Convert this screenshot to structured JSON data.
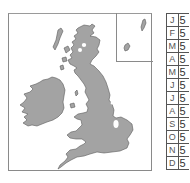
{
  "map": {
    "region": "British Isles",
    "land_color": "#a3a3a3",
    "outline_color": "#5a5a5a",
    "frame_color": "#8a8a8a",
    "inset": {
      "label": "Shetland/Orkney inset"
    },
    "highlights": [
      {
        "name": "Scottish Highlands spots",
        "color": "#ffffff"
      },
      {
        "name": "East Anglia / The Wash",
        "color": "#ffffff"
      }
    ]
  },
  "table": {
    "rows": [
      {
        "month": "J",
        "value": "5"
      },
      {
        "month": "F",
        "value": "5"
      },
      {
        "month": "M",
        "value": "5"
      },
      {
        "month": "A",
        "value": "5"
      },
      {
        "month": "M",
        "value": "5"
      },
      {
        "month": "J",
        "value": "5"
      },
      {
        "month": "J",
        "value": "5"
      },
      {
        "month": "A",
        "value": "5"
      },
      {
        "month": "S",
        "value": "5"
      },
      {
        "month": "O",
        "value": "5"
      },
      {
        "month": "N",
        "value": "5"
      },
      {
        "month": "D",
        "value": "5"
      }
    ]
  }
}
